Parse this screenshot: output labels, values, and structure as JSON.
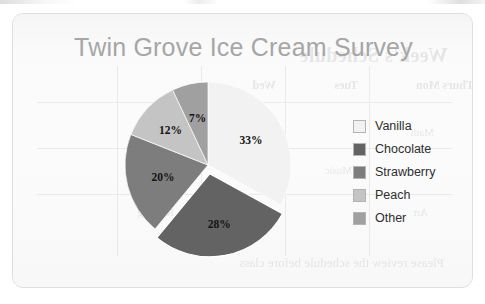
{
  "chart_data": {
    "type": "pie",
    "title": "Twin Grove Ice Cream Survey",
    "categories": [
      "Vanilla",
      "Chocolate",
      "Strawberry",
      "Peach",
      "Other"
    ],
    "values": [
      33,
      28,
      20,
      12,
      7
    ],
    "value_labels": [
      "33%",
      "28%",
      "20%",
      "12%",
      "7%"
    ],
    "unit": "percent",
    "total": 100,
    "start_angle_deg": 0,
    "direction": "clockwise",
    "exploded_slice": "Chocolate",
    "legend_position": "right",
    "grid": false,
    "colors": [
      "#f2f2f2",
      "#636363",
      "#7d7d7d",
      "#c4c4c4",
      "#a0a0a0"
    ],
    "title_color": "#a6a6a6",
    "label_color": "#141414",
    "slices": [
      {
        "label": "Vanilla",
        "value": 33,
        "display": "33%",
        "color": "#f2f2f2",
        "exploded": false
      },
      {
        "label": "Chocolate",
        "value": 28,
        "display": "28%",
        "color": "#636363",
        "exploded": true
      },
      {
        "label": "Strawberry",
        "value": 20,
        "display": "20%",
        "color": "#7d7d7d",
        "exploded": false
      },
      {
        "label": "Peach",
        "value": 12,
        "display": "12%",
        "color": "#c4c4c4",
        "exploded": false
      },
      {
        "label": "Other",
        "value": 7,
        "display": "7%",
        "color": "#a0a0a0",
        "exploded": false
      }
    ]
  },
  "legend": {
    "items": [
      {
        "label": "Vanilla",
        "color": "#f2f2f2"
      },
      {
        "label": "Chocolate",
        "color": "#636363"
      },
      {
        "label": "Strawberry",
        "color": "#7d7d7d"
      },
      {
        "label": "Peach",
        "color": "#c4c4c4"
      },
      {
        "label": "Other",
        "color": "#a0a0a0"
      }
    ]
  },
  "showthrough": {
    "title": "Week's Schedule",
    "headers": [
      "Mon",
      "Tues",
      "Wed",
      "Thurs",
      "Fri"
    ],
    "cells": [
      "Math",
      "Science",
      "Music",
      "History",
      "Art",
      "Reading"
    ],
    "footer": "Please review the schedule before class"
  }
}
